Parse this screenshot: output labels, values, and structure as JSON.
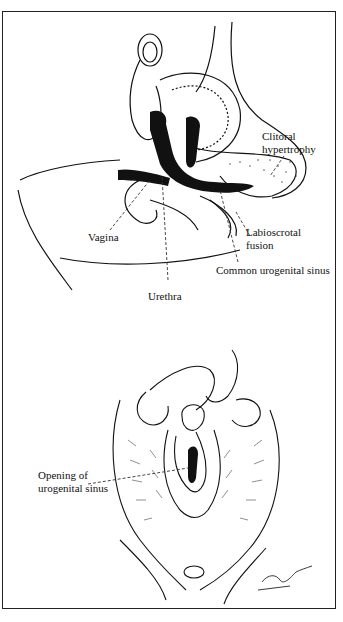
{
  "figure": {
    "top_panel": {
      "description": "Sagittal section showing virilized female anatomy",
      "labels": {
        "clitoral_hypertrophy": [
          "Clitoral",
          "hypertrophy"
        ],
        "vagina": "Vagina",
        "labioscrotal_fusion": [
          "Labioscrotal",
          "fusion"
        ],
        "common_urogenital_sinus": "Common urogenital sinus",
        "urethra": "Urethra"
      }
    },
    "bottom_panel": {
      "description": "External view of perineum with labia retracted",
      "labels": {
        "opening_urogenital_sinus": [
          "Opening of",
          "urogenital sinus"
        ]
      },
      "signature": "Tagim"
    },
    "colors": {
      "ink": "#111111",
      "background": "#ffffff",
      "border": "#222222"
    }
  }
}
